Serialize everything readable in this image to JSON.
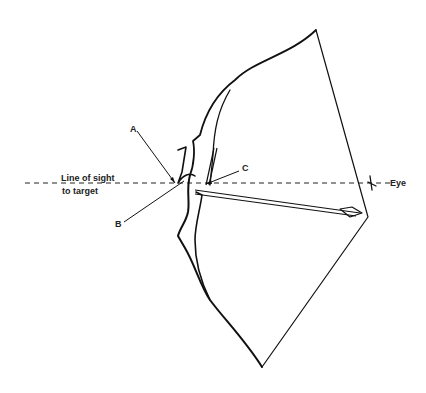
{
  "diagram": {
    "labels": {
      "line_of_sight": "Line of sight",
      "to_target": "to target",
      "eye": "Eye",
      "a": "A",
      "b": "B",
      "c": "C"
    },
    "colors": {
      "background": "#ffffff",
      "ink": "#111111"
    }
  }
}
